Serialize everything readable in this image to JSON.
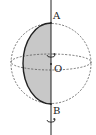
{
  "diagram": {
    "labels": {
      "top_point": "A",
      "center_point": "O",
      "bottom_point": "B"
    },
    "colors": {
      "stroke": "#222222",
      "dashed": "#555555",
      "shade": "#c8c8c8",
      "background": "#ffffff"
    },
    "elements": [
      "rotation-axis",
      "sphere-outline-dashed",
      "equator-ellipse-dashed",
      "semicircle-arc",
      "shaded-half-disc",
      "rotation-arrow-top",
      "rotation-arrow-bottom"
    ]
  }
}
